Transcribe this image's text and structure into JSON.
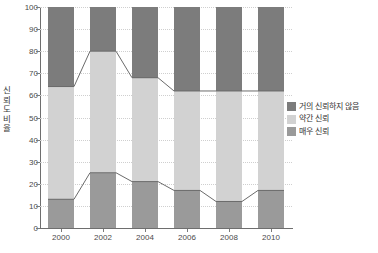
{
  "chart_data": {
    "type": "bar",
    "title": "",
    "subtitle": "",
    "xlabel": "",
    "ylabel": "신뢰도 비율",
    "categories": [
      "2000",
      "2002",
      "2004",
      "2006",
      "2008",
      "2010"
    ],
    "ylim": [
      0,
      100
    ],
    "yticks": [
      0,
      10,
      20,
      30,
      40,
      50,
      60,
      70,
      80,
      90,
      100
    ],
    "ytick_labels": [
      "0",
      "10",
      "20",
      "30",
      "40",
      "50",
      "60",
      "70",
      "80",
      "90",
      "100"
    ],
    "grid": true,
    "stacked": true,
    "stack_total": 100,
    "legend_position": "right",
    "series": [
      {
        "name": "거의 신뢰하지 않음",
        "color": "#7c7c7c",
        "values": [
          36,
          20,
          32,
          38,
          38,
          38
        ],
        "cumulative_top": [
          100,
          100,
          100,
          100,
          100,
          100
        ],
        "cumulative_bottom": [
          64,
          80,
          68,
          62,
          62,
          62
        ]
      },
      {
        "name": "약간 신뢰",
        "color": "#d2d2d2",
        "values": [
          51,
          55,
          47,
          45,
          50,
          45
        ],
        "cumulative_top": [
          64,
          80,
          68,
          62,
          62,
          62
        ],
        "cumulative_bottom": [
          13,
          25,
          21,
          17,
          12,
          17
        ]
      },
      {
        "name": "매우 신뢰",
        "color": "#9a9a9a",
        "values": [
          13,
          25,
          21,
          17,
          12,
          17
        ],
        "cumulative_top": [
          13,
          25,
          21,
          17,
          12,
          17
        ],
        "cumulative_bottom": [
          0,
          0,
          0,
          0,
          0,
          0
        ]
      }
    ],
    "connector_lines": [
      {
        "name": "거의-신뢰하지-않음-경계선",
        "values": [
          64,
          80,
          68,
          62,
          62,
          62
        ],
        "color": "#6b6b6b"
      },
      {
        "name": "매우-신뢰-경계선",
        "values": [
          13,
          25,
          21,
          17,
          12,
          17
        ],
        "color": "#6b6b6b"
      }
    ]
  },
  "legend": {
    "items": [
      {
        "label": "거의 신뢰하지 않음",
        "color": "#7c7c7c"
      },
      {
        "label": "약간 신뢰",
        "color": "#d2d2d2"
      },
      {
        "label": "매우 신뢰",
        "color": "#9a9a9a"
      }
    ]
  },
  "axes": {
    "y_title_chars": [
      "신",
      "뢰",
      "도",
      "비",
      "율"
    ]
  },
  "colors": {
    "grid": "#d9d9d9",
    "axis": "#6e6e6e",
    "text": "#4a4a4a",
    "plot_background": "#ffffff"
  }
}
